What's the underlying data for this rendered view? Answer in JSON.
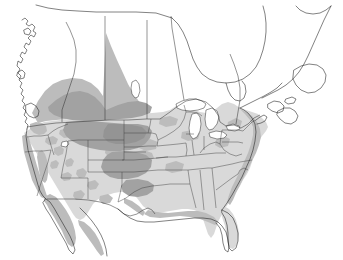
{
  "figure": {
    "type": "distribution-range-map",
    "region": "North America",
    "title": "",
    "caption": "",
    "background_color": "#ffffff",
    "outline_color": "#1a1a1a"
  },
  "legend": {
    "visible": false,
    "entries": [
      {
        "label": "base land (United States)",
        "color": "#d9d9d9"
      },
      {
        "label": "moderate density",
        "color": "#bcbcbc"
      },
      {
        "label": "high density",
        "color": "#a2a2a2"
      },
      {
        "label": "unshaded (Canada, Mexico, water)",
        "color": "#ffffff"
      }
    ]
  },
  "layers": {
    "country_borders": "Canada-United States and United States-Mexico international boundaries drawn as thin lines",
    "state_borders": "United States state outlines drawn as thin lines",
    "lakes": "Great Lakes, Great Salt Lake and Lake Winnipeg shown unfilled",
    "coastline": "Pacific, Atlantic, Gulf of Mexico, Hudson Bay and Arctic coasts"
  },
  "shaded_regions": {
    "high_density": [
      "Central Canadian prairies (Alberta / Saskatchewan peak)",
      "Montana",
      "Wyoming",
      "North Dakota",
      "South Dakota",
      "Nebraska",
      "Kansas",
      "Colorado eastern plains"
    ],
    "moderate_density": [
      "British Columbia interior",
      "Pacific coastal ranges",
      "Sierra Nevada",
      "Great Basin patches",
      "Southern Rocky Mountains",
      "Baja California peninsula",
      "Gulf of Mexico coastal strip",
      "Atlantic coastal strip",
      "Appalachian patches"
    ]
  },
  "map_features": {
    "great_lakes": [
      "Lake Superior",
      "Lake Michigan",
      "Lake Huron",
      "Lake Erie",
      "Lake Ontario"
    ],
    "water_bodies": [
      "Hudson Bay",
      "James Bay",
      "Gulf of Mexico",
      "Gulf of California",
      "Pacific Ocean",
      "Atlantic Ocean"
    ],
    "landforms": [
      "Florida peninsula",
      "Baja California",
      "Nova Scotia",
      "Newfoundland",
      "Vancouver Island",
      "Alaska panhandle"
    ]
  }
}
